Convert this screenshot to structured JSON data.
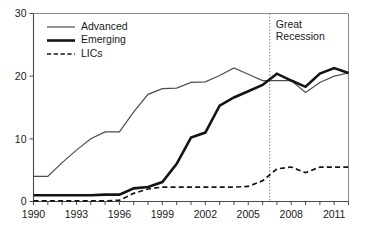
{
  "chart_data": {
    "type": "line",
    "title": "",
    "subtitle": "",
    "xlabel": "",
    "ylabel": "",
    "xlim": [
      1990,
      2012
    ],
    "ylim": [
      0,
      30
    ],
    "yticks": [
      0,
      10,
      20,
      30
    ],
    "ytick_labels": [
      "0",
      "10",
      "20",
      "30"
    ],
    "xticks": [
      1990,
      1993,
      1996,
      1999,
      2002,
      2005,
      2008,
      2011
    ],
    "xtick_labels": [
      "1990",
      "1993",
      "1996",
      "1999",
      "2002",
      "2005",
      "2008",
      "2011"
    ],
    "x_minor_ticks": [
      1990,
      1991,
      1992,
      1993,
      1994,
      1995,
      1996,
      1997,
      1998,
      1999,
      2000,
      2001,
      2002,
      2003,
      2004,
      2005,
      2006,
      2007,
      2008,
      2009,
      2010,
      2011,
      2012
    ],
    "grid": false,
    "legend_position": "top-left",
    "x": [
      1990,
      1991,
      1992,
      1993,
      1994,
      1995,
      1996,
      1997,
      1998,
      1999,
      2000,
      2001,
      2002,
      2003,
      2004,
      2005,
      2006,
      2007,
      2008,
      2009,
      2010,
      2011,
      2012
    ],
    "series": [
      {
        "name": "Advanced",
        "style": "solid-thin",
        "color": "#4d4d4d",
        "values": [
          4.0,
          4.0,
          6.2,
          8.2,
          10.0,
          11.1,
          11.1,
          14.3,
          17.1,
          18.0,
          18.1,
          19.0,
          19.1,
          20.1,
          21.3,
          20.3,
          19.3,
          19.3,
          19.3,
          17.4,
          19.0,
          20.0,
          20.5
        ]
      },
      {
        "name": "Emerging",
        "style": "solid-thick",
        "color": "#141414",
        "values": [
          1.0,
          1.0,
          1.0,
          1.0,
          1.0,
          1.1,
          1.1,
          2.1,
          2.3,
          3.1,
          6.0,
          10.2,
          11.0,
          15.3,
          16.6,
          17.6,
          18.6,
          20.4,
          19.3,
          18.3,
          20.4,
          21.3,
          20.5
        ]
      },
      {
        "name": "LICs",
        "style": "dashed",
        "color": "#141414",
        "values": [
          0.1,
          0.1,
          0.1,
          0.1,
          0.1,
          0.1,
          0.2,
          1.3,
          2.0,
          2.3,
          2.3,
          2.3,
          2.3,
          2.3,
          2.3,
          2.4,
          3.3,
          5.2,
          5.5,
          4.6,
          5.5,
          5.5,
          5.5
        ]
      }
    ],
    "annotations": [
      {
        "name": "great-recession",
        "lines": [
          "Great",
          "Recession"
        ],
        "x_value": 2006.5,
        "marker": "vertical-dotted-line"
      }
    ]
  }
}
